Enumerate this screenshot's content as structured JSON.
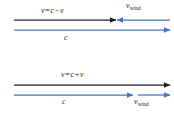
{
  "figure": {
    "type": "physics-vector-diagram",
    "background_color": "#ffffff",
    "colors": {
      "resultant_vector": "#231f20",
      "component_vector": "#4472c4",
      "text": "#231f20"
    },
    "panels": [
      {
        "id": "headwind",
        "caption_case": "against the wind",
        "labels": {
          "resultant": {
            "full_text": "v = c − v",
            "variable": "v",
            "equals": "=",
            "term_one": "c",
            "operator": "−",
            "term_two": "v"
          },
          "wind": {
            "full_text": "v_wind",
            "variable": "v",
            "subscript": "wind"
          },
          "speed": {
            "full_text": "c",
            "variable": "c"
          }
        },
        "vectors": [
          {
            "name": "resultant-velocity-arrow",
            "color": "#231f20",
            "direction": "right",
            "x_start": 14,
            "x_end": 116,
            "y": 20
          },
          {
            "name": "wind-velocity-arrow",
            "color": "#4472c4",
            "direction": "left",
            "x_start": 170,
            "x_end": 116,
            "y": 20
          },
          {
            "name": "sound-speed-arrow",
            "color": "#4472c4",
            "direction": "right",
            "x_start": 14,
            "x_end": 170,
            "y": 30
          }
        ]
      },
      {
        "id": "tailwind",
        "caption_case": "with the wind",
        "labels": {
          "resultant": {
            "full_text": "v = c + v",
            "variable": "v",
            "equals": "=",
            "term_one": "c",
            "operator": "+",
            "term_two": "v"
          },
          "wind": {
            "full_text": "v_wind",
            "variable": "v",
            "subscript": "wind"
          },
          "speed": {
            "full_text": "c",
            "variable": "c"
          }
        },
        "vectors": [
          {
            "name": "resultant-velocity-arrow",
            "color": "#231f20",
            "direction": "right",
            "x_start": 14,
            "x_end": 170,
            "y": 23
          },
          {
            "name": "sound-speed-arrow",
            "color": "#4472c4",
            "direction": "right",
            "x_start": 14,
            "x_end": 133,
            "y": 33
          },
          {
            "name": "wind-velocity-arrow",
            "color": "#4472c4",
            "direction": "right",
            "x_start": 138,
            "x_end": 170,
            "y": 33
          }
        ]
      }
    ]
  }
}
